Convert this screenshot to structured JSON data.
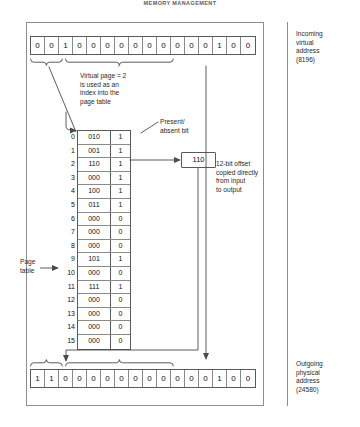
{
  "figure": {
    "header": "MEMORY MANAGEMENT",
    "virtual_address": {
      "bits": [
        "0",
        "0",
        "1",
        "0",
        "0",
        "0",
        "0",
        "0",
        "0",
        "0",
        "0",
        "0",
        "0",
        "1",
        "0",
        "0"
      ],
      "label": "Incoming\nvirtual\naddress\n(8196)",
      "decimal": "8196"
    },
    "physical_address": {
      "bits": [
        "1",
        "1",
        "0",
        "0",
        "0",
        "0",
        "0",
        "0",
        "0",
        "0",
        "0",
        "0",
        "0",
        "1",
        "0",
        "0"
      ],
      "label": "Outgoing\nphysical\naddress\n(24580)",
      "decimal": "24580"
    },
    "notes": {
      "virtual_page": "Virtual page = 2\nis used as an\nindex into the\npage table",
      "present_absent": "Present/\nabsent bit",
      "offset": "12-bit offset\ncopied directly\nfrom input\nto output",
      "page_table_label": "Page\ntable"
    },
    "selected_frame": "110",
    "page_table": {
      "columns": [
        "index",
        "frame",
        "present"
      ],
      "rows": [
        {
          "index": "0",
          "frame": "010",
          "present": "1"
        },
        {
          "index": "1",
          "frame": "001",
          "present": "1"
        },
        {
          "index": "2",
          "frame": "110",
          "present": "1"
        },
        {
          "index": "3",
          "frame": "000",
          "present": "1"
        },
        {
          "index": "4",
          "frame": "100",
          "present": "1"
        },
        {
          "index": "5",
          "frame": "011",
          "present": "1"
        },
        {
          "index": "6",
          "frame": "000",
          "present": "0"
        },
        {
          "index": "7",
          "frame": "000",
          "present": "0"
        },
        {
          "index": "8",
          "frame": "000",
          "present": "0"
        },
        {
          "index": "9",
          "frame": "101",
          "present": "1"
        },
        {
          "index": "10",
          "frame": "000",
          "present": "0"
        },
        {
          "index": "11",
          "frame": "111",
          "present": "1"
        },
        {
          "index": "12",
          "frame": "000",
          "present": "0"
        },
        {
          "index": "13",
          "frame": "000",
          "present": "0"
        },
        {
          "index": "14",
          "frame": "000",
          "present": "0"
        },
        {
          "index": "15",
          "frame": "000",
          "present": "0"
        }
      ]
    },
    "colors": {
      "line": "#5a5a5a",
      "frame": "#8d8d8d",
      "text": "#1a1a1a"
    }
  }
}
